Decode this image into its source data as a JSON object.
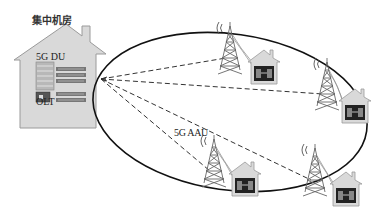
{
  "diagram": {
    "central_office": {
      "title": "集中机房",
      "du_label": "5G DU",
      "olt_label": "OLT"
    },
    "aau_label": "5G AAU",
    "ring": {
      "cx": 230,
      "cy": 112,
      "rx": 138,
      "ry": 78,
      "rotate": 8
    },
    "hub_point": {
      "x": 101,
      "y": 79
    },
    "sites": [
      {
        "name": "site-1",
        "tower_x": 230,
        "tower_y": 48,
        "house_x": 252,
        "house_y": 58
      },
      {
        "name": "site-2",
        "tower_x": 327,
        "tower_y": 84,
        "house_x": 343,
        "house_y": 97
      },
      {
        "name": "site-3",
        "tower_x": 214,
        "tower_y": 161,
        "house_x": 233,
        "house_y": 170
      },
      {
        "name": "site-4",
        "tower_x": 315,
        "tower_y": 170,
        "house_x": 334,
        "house_y": 180
      }
    ],
    "colors": {
      "house_fill": "#d9d9d9",
      "house_stroke": "#9a9a9a",
      "line": "#111111",
      "tower": "#666666"
    }
  }
}
